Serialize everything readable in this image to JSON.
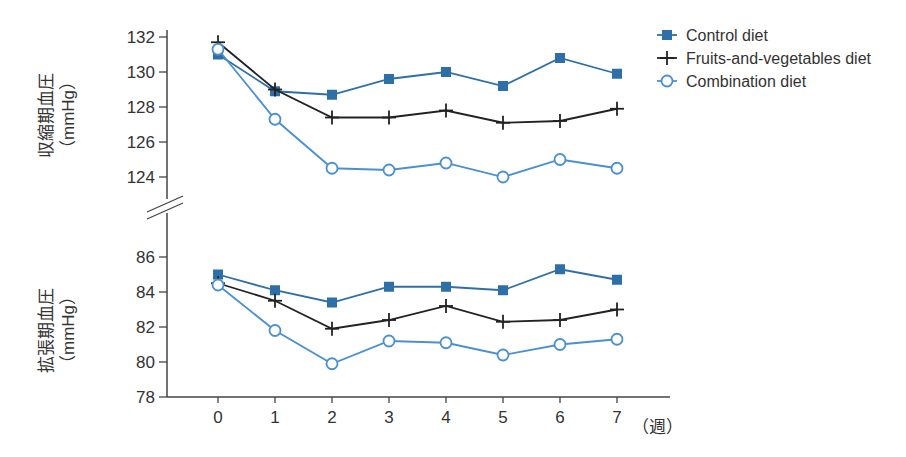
{
  "chart_data": {
    "type": "line",
    "x": [
      0,
      1,
      2,
      3,
      4,
      5,
      6,
      7
    ],
    "xlabel": "（週）",
    "panels": [
      {
        "name": "systolic",
        "ylabel": "収縮期血圧",
        "yunit": "（mmHg）",
        "ylim": [
          123,
          132
        ],
        "yticks": [
          132,
          130,
          128,
          126,
          124
        ],
        "series": [
          {
            "name": "Control diet",
            "marker": "square",
            "color": "#2f6fa8",
            "values": [
              131.0,
              128.9,
              128.7,
              129.6,
              130.0,
              129.2,
              130.8,
              129.9
            ]
          },
          {
            "name": "Fruits-and-vegetables diet",
            "marker": "plus",
            "color": "#222222",
            "values": [
              131.7,
              129.0,
              127.4,
              127.4,
              127.8,
              127.1,
              127.2,
              127.9
            ]
          },
          {
            "name": "Combination diet",
            "marker": "circle",
            "color": "#4a90d0",
            "values": [
              131.3,
              127.3,
              124.5,
              124.4,
              124.8,
              124.0,
              125.0,
              124.5
            ]
          }
        ]
      },
      {
        "name": "diastolic",
        "ylabel": "拡張期血圧",
        "yunit": "（mmHg）",
        "ylim": [
          78,
          86
        ],
        "yticks": [
          86,
          84,
          82,
          80,
          78
        ],
        "series": [
          {
            "name": "Control diet",
            "marker": "square",
            "color": "#2f6fa8",
            "values": [
              85.0,
              84.1,
              83.4,
              84.3,
              84.3,
              84.1,
              85.3,
              84.7
            ]
          },
          {
            "name": "Fruits-and-vegetables diet",
            "marker": "plus",
            "color": "#222222",
            "values": [
              84.5,
              83.5,
              81.9,
              82.4,
              83.2,
              82.3,
              82.4,
              83.0
            ]
          },
          {
            "name": "Combination diet",
            "marker": "circle",
            "color": "#4a90d0",
            "values": [
              84.4,
              81.8,
              79.9,
              81.2,
              81.1,
              80.4,
              81.0,
              81.3
            ]
          }
        ]
      }
    ],
    "legend": [
      "Control diet",
      "Fruits-and-vegetables diet",
      "Combination diet"
    ],
    "legend_position": "top-right",
    "grid": false
  },
  "labels": {
    "top_ylabel": "収縮期血圧",
    "top_unit": "（mmHg）",
    "bottom_ylabel": "拡張期血圧",
    "bottom_unit": "（mmHg）",
    "xunit": "（週）",
    "legend": [
      "Control diet",
      "Fruits-and-vegetables diet",
      "Combination diet"
    ]
  }
}
